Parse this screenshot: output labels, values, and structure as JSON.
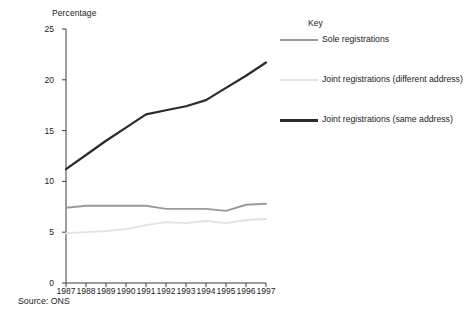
{
  "chart_data": {
    "type": "line",
    "title": "",
    "xlabel": "",
    "ylabel": "Percentage",
    "ylim": [
      0,
      25
    ],
    "yticks": [
      0,
      5,
      10,
      15,
      20,
      25
    ],
    "grid": false,
    "legend_position": "right",
    "legend_title": "Key",
    "categories": [
      "1987",
      "1988",
      "1989",
      "1990",
      "1991",
      "1992",
      "1993",
      "1994",
      "1995",
      "1996",
      "1997"
    ],
    "x": [
      1987,
      1988,
      1989,
      1990,
      1991,
      1992,
      1993,
      1994,
      1995,
      1996,
      1997
    ],
    "series": [
      {
        "name": "Sole registrations",
        "color": "#9a9a9a",
        "width": 1.9,
        "values": [
          7.4,
          7.6,
          7.6,
          7.6,
          7.6,
          7.3,
          7.3,
          7.3,
          7.1,
          7.7,
          7.8
        ]
      },
      {
        "name": "Joint registrations (different address)",
        "color": "#e2e2e2",
        "width": 1.8,
        "values": [
          4.9,
          5.0,
          5.1,
          5.3,
          5.7,
          6.0,
          5.9,
          6.1,
          5.9,
          6.2,
          6.3
        ]
      },
      {
        "name": "Joint registrations (same address)",
        "color": "#2b2b2b",
        "width": 2.2,
        "values": [
          11.2,
          12.6,
          14.0,
          15.3,
          16.6,
          17.0,
          17.4,
          18.0,
          19.2,
          20.4,
          21.7
        ]
      }
    ],
    "source": "Source: ONS"
  },
  "axis": {
    "y_title": "Percentage",
    "y_tick_labels": [
      "25",
      "20",
      "15",
      "10",
      "5",
      "0"
    ],
    "x_tick_labels": [
      "1987",
      "1988",
      "1989",
      "1990",
      "1991",
      "1992",
      "1993",
      "1994",
      "1995",
      "1996",
      "1997"
    ]
  },
  "legend": {
    "title": "Key",
    "items": [
      {
        "label": "Sole registrations",
        "color": "#9a9a9a",
        "thickness": "2px"
      },
      {
        "label": "Joint registrations (different address)",
        "color": "#e4e4e4",
        "thickness": "2px"
      },
      {
        "label": "Joint registrations (same address)",
        "color": "#2b2b2b",
        "thickness": "3px"
      }
    ]
  },
  "footer": {
    "source": "Source: ONS"
  }
}
